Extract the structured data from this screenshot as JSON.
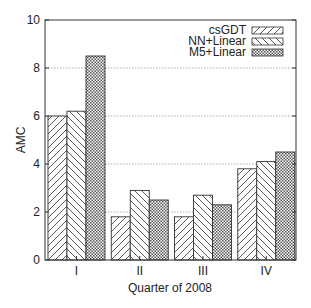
{
  "chart_data": {
    "type": "bar",
    "title": "",
    "xlabel": "Quarter of 2008",
    "ylabel": "AMC",
    "categories": [
      "I",
      "II",
      "III",
      "IV"
    ],
    "series": [
      {
        "name": "csGDT",
        "pattern": "forward-diagonal",
        "values": [
          6.0,
          1.8,
          1.8,
          3.8
        ]
      },
      {
        "name": "NN+Linear",
        "pattern": "back-diagonal",
        "values": [
          6.2,
          2.9,
          2.7,
          4.1
        ]
      },
      {
        "name": "M5+Linear",
        "pattern": "crosshatch",
        "values": [
          8.5,
          2.5,
          2.3,
          4.5
        ]
      }
    ],
    "ylim": [
      0,
      10
    ],
    "yticks": [
      0,
      2,
      4,
      6,
      8,
      10
    ],
    "grid": {
      "y": true,
      "style": "dotted"
    },
    "legend": {
      "position": "top-right",
      "entries": [
        "csGDT",
        "NN+Linear",
        "M5+Linear"
      ]
    }
  },
  "colors": {
    "axis": "#333333",
    "grid": "#9a9a9a",
    "hatch": "#444444",
    "bar_fill": "#ffffff"
  }
}
